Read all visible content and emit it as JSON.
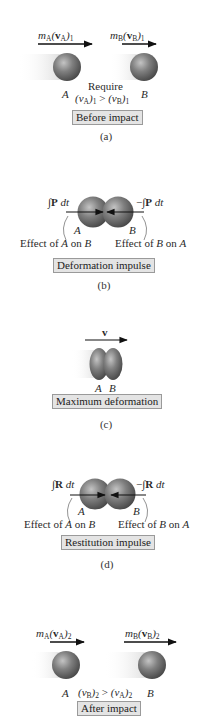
{
  "colors": {
    "sphere_light": "#bdbdbd",
    "sphere_mid": "#7a7a7a",
    "sphere_dark": "#4a4a4a",
    "box_fill": "#e4e4e4",
    "box_border": "#9a9a9a",
    "arrow": "#111111",
    "text": "#2a2a2a"
  },
  "panels": [
    {
      "id": "a",
      "caption": "(a)",
      "box_label": "Before impact",
      "momentum_A": {
        "m": "m",
        "m_sub": "A",
        "v": "v",
        "v_sub": "A",
        "index": "1"
      },
      "momentum_B": {
        "m": "m",
        "m_sub": "B",
        "v": "v",
        "v_sub": "B",
        "index": "1"
      },
      "label_A": "A",
      "label_B": "B",
      "require_label": "Require",
      "condition": {
        "left": "v",
        "left_sub": "A",
        "left_idx": "1",
        "op": ">",
        "right": "v",
        "right_sub": "B",
        "right_idx": "1"
      }
    },
    {
      "id": "b",
      "caption": "(b)",
      "box_label": "Deformation impulse",
      "impulse_left": {
        "sign": "",
        "integral": "∫",
        "symbol": "P",
        "dt": "dt"
      },
      "impulse_right": {
        "sign": "−",
        "integral": "∫",
        "symbol": "P",
        "dt": "dt"
      },
      "label_A": "A",
      "label_B": "B",
      "effect_left": {
        "prefix": "Effect of ",
        "a": "A",
        "mid": " on ",
        "b": "B"
      },
      "effect_right": {
        "prefix": "Effect of ",
        "a": "B",
        "mid": " on ",
        "b": "A"
      }
    },
    {
      "id": "c",
      "caption": "(c)",
      "box_label": "Maximum deformation",
      "velocity": "v",
      "label_A": "A",
      "label_B": "B"
    },
    {
      "id": "d",
      "caption": "(d)",
      "box_label": "Restitution impulse",
      "impulse_left": {
        "sign": "",
        "integral": "∫",
        "symbol": "R",
        "dt": "dt"
      },
      "impulse_right": {
        "sign": "−",
        "integral": "∫",
        "symbol": "R",
        "dt": "dt"
      },
      "label_A": "A",
      "label_B": "B",
      "effect_left": {
        "prefix": "Effect of ",
        "a": "A",
        "mid": " on ",
        "b": "B"
      },
      "effect_right": {
        "prefix": "Effect of ",
        "a": "B",
        "mid": " on ",
        "b": "A"
      }
    },
    {
      "id": "e",
      "caption": "",
      "box_label": "After impact",
      "momentum_A": {
        "m": "m",
        "m_sub": "A",
        "v": "v",
        "v_sub": "A",
        "index": "2"
      },
      "momentum_B": {
        "m": "m",
        "m_sub": "B",
        "v": "v",
        "v_sub": "B",
        "index": "2"
      },
      "label_A": "A",
      "label_B": "B",
      "condition": {
        "left": "v",
        "left_sub": "B",
        "left_idx": "2",
        "op": ">",
        "right": "v",
        "right_sub": "A",
        "right_idx": "2"
      }
    }
  ]
}
